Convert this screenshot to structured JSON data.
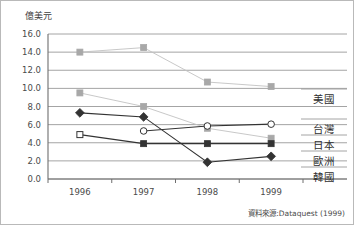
{
  "figure": {
    "y_unit_label": "億美元",
    "source_note": "資料來源:Dataquest (1999)"
  },
  "axes": {
    "y_ticks": [
      "16.0",
      "14.0",
      "12.0",
      "10.0",
      "8.0",
      "6.0",
      "4.0",
      "2.0",
      "0.0"
    ],
    "x_ticks": [
      "1996",
      "1997",
      "1998",
      "1999"
    ]
  },
  "legend": {
    "items": [
      {
        "label": "美國"
      },
      {
        "label": "台灣"
      },
      {
        "label": "日本"
      },
      {
        "label": "歐洲"
      },
      {
        "label": "韓國"
      }
    ]
  },
  "colors": {
    "gray_series": "#a8a8a8",
    "light_gray_series": "#c2c2c2",
    "dark_series": "#333333",
    "gridline": "#9a9a9a",
    "axis": "#6e6e6e",
    "text": "#3d3d3d",
    "background": "#ffffff"
  },
  "chart_data": {
    "type": "line",
    "title": "",
    "xlabel": "",
    "ylabel": "億美元",
    "x": [
      "1996",
      "1997",
      "1998",
      "1999"
    ],
    "ylim": [
      0.0,
      16.0
    ],
    "ytick_step": 2.0,
    "grid": true,
    "legend_position": "right-inline",
    "series": [
      {
        "name": "美國",
        "marker": "filled-square",
        "color": "#a8a8a8",
        "values": [
          14.0,
          14.5,
          10.7,
          10.2
        ]
      },
      {
        "name": "台灣",
        "marker": "filled-square",
        "color": "#a8a8a8",
        "values": [
          9.5,
          8.0,
          5.6,
          4.5
        ]
      },
      {
        "name": "日本",
        "marker": "open-circle",
        "color": "#333333",
        "values": [
          null,
          5.3,
          5.85,
          6.05
        ]
      },
      {
        "name": "歐洲",
        "marker": "square",
        "color": "#333333",
        "values": [
          4.9,
          3.9,
          3.9,
          3.9
        ]
      },
      {
        "name": "韓國",
        "marker": "filled-diamond",
        "color": "#333333",
        "values": [
          7.3,
          6.85,
          1.85,
          2.5
        ]
      }
    ],
    "annotations": [
      "資料來源:Dataquest (1999)"
    ]
  }
}
